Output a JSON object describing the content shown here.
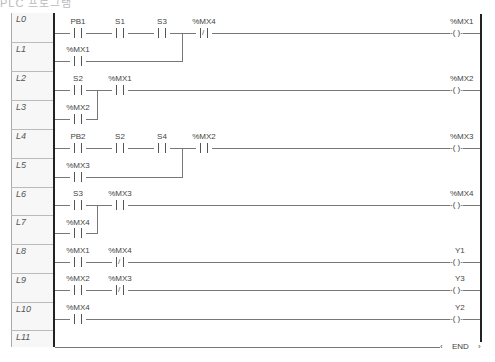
{
  "title": "PLC 프로그램",
  "rows": [
    "L0",
    "L1",
    "L2",
    "L3",
    "L4",
    "L5",
    "L6",
    "L7",
    "L8",
    "L9",
    "L10",
    "L11"
  ],
  "rungs": [
    {
      "contacts": [
        {
          "label": "PB1",
          "type": "NO"
        },
        {
          "label": "S1",
          "type": "NO"
        },
        {
          "label": "S3",
          "type": "NO"
        },
        {
          "label": "%MX4",
          "type": "NC"
        }
      ],
      "branch": [
        {
          "label": "%MX1",
          "type": "NO"
        }
      ],
      "coil": "%MX1"
    },
    {
      "contacts": [
        {
          "label": "S2",
          "type": "NO"
        },
        {
          "label": "%MX1",
          "type": "NO"
        }
      ],
      "branch": [
        {
          "label": "%MX2",
          "type": "NO"
        }
      ],
      "coil": "%MX2"
    },
    {
      "contacts": [
        {
          "label": "PB2",
          "type": "NO"
        },
        {
          "label": "S2",
          "type": "NO"
        },
        {
          "label": "S4",
          "type": "NO"
        },
        {
          "label": "%MX2",
          "type": "NO"
        }
      ],
      "branch": [
        {
          "label": "%MX3",
          "type": "NO"
        }
      ],
      "coil": "%MX3"
    },
    {
      "contacts": [
        {
          "label": "S3",
          "type": "NO"
        },
        {
          "label": "%MX3",
          "type": "NO"
        }
      ],
      "branch": [
        {
          "label": "%MX4",
          "type": "NO"
        }
      ],
      "coil": "%MX4"
    },
    {
      "contacts": [
        {
          "label": "%MX1",
          "type": "NO"
        },
        {
          "label": "%MX4",
          "type": "NC"
        }
      ],
      "coil": "Y1"
    },
    {
      "contacts": [
        {
          "label": "%MX2",
          "type": "NO"
        },
        {
          "label": "%MX3",
          "type": "NC"
        }
      ],
      "coil": "Y3"
    },
    {
      "contacts": [
        {
          "label": "%MX4",
          "type": "NO"
        }
      ],
      "coil": "Y2"
    }
  ],
  "coil_symbol": "-( )-",
  "end_label": "END"
}
